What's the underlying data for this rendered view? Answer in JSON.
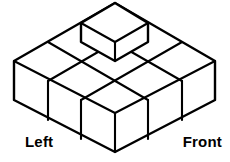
{
  "figure": {
    "kind": "isometric-cube-stack",
    "background_color": "#ffffff",
    "line_color": "#000000",
    "base_layer_rows": 3,
    "base_layer_cols": 3,
    "base_layer_cube_count": 9,
    "top_layer_cube_count": 1,
    "total_cube_count": 10,
    "geometry": {
      "apex": [
        117,
        3
      ],
      "left_vertex": [
        14,
        61
      ],
      "right_vertex": [
        215,
        61
      ],
      "bottom_vertex": [
        115,
        152
      ],
      "cube_half_width": 33.6,
      "cube_half_depth": 19.4,
      "cube_height": 39.0
    }
  },
  "labels": {
    "left": "Left",
    "front": "Front"
  }
}
